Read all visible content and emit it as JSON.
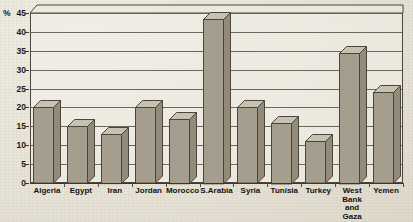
{
  "chart_data": {
    "type": "bar",
    "title": "",
    "subtitle": "",
    "xlabel": "",
    "ylabel": "%",
    "ylim": [
      0,
      45
    ],
    "ytick_step": 5,
    "yticks": [
      "0",
      "5",
      "10",
      "15",
      "20",
      "25",
      "30",
      "35",
      "40",
      "45"
    ],
    "grid": true,
    "legend": null,
    "style": "3d-bar",
    "categories": [
      "Algeria",
      "Egypt",
      "Iran",
      "Jordan",
      "Morocco",
      "S.Arabia",
      "Syria",
      "Tunisia",
      "Turkey",
      "West\nBank\nand\nGaza",
      "Yemen"
    ],
    "values": [
      20,
      15,
      13,
      20,
      17,
      43.5,
      20,
      16,
      11,
      34.5,
      24
    ],
    "annotations": []
  },
  "axis": {
    "unit_label": "%",
    "unit_top_value": "45"
  },
  "colors": {
    "bar_face": "#b0a99a",
    "bar_side": "#928b79",
    "bar_top": "#c7c1b2",
    "outline": "#4a463c",
    "paper": "#e9e6dc",
    "grid": "#6c675b",
    "text": "#14120f"
  }
}
